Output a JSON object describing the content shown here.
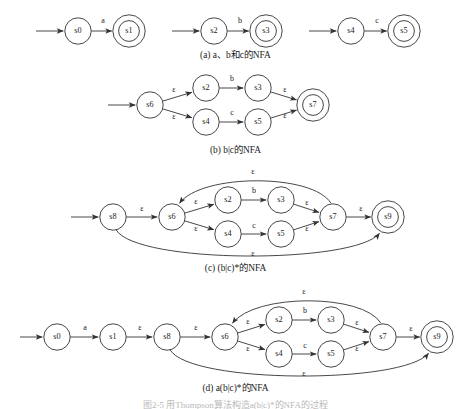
{
  "figure": {
    "footer_text": "图2-5  用Thompson算法构造a(b|c)*的NFA的过程",
    "stroke_color": "#333333",
    "text_color": "#1a1a1a",
    "background": "#ffffff"
  },
  "panels": [
    {
      "id": "a",
      "caption": "(a) a、b和c的NFA",
      "states": [
        {
          "name": "s0",
          "x": 78,
          "y": 31,
          "accepting": false
        },
        {
          "name": "s1",
          "x": 129,
          "y": 31,
          "accepting": true
        },
        {
          "name": "s2",
          "x": 214,
          "y": 31,
          "accepting": false
        },
        {
          "name": "s3",
          "x": 266,
          "y": 31,
          "accepting": true
        },
        {
          "name": "s4",
          "x": 351,
          "y": 31,
          "accepting": false
        },
        {
          "name": "s5",
          "x": 404,
          "y": 31,
          "accepting": true
        }
      ],
      "transitions": [
        {
          "from": "s0",
          "to": "s1",
          "label": "a",
          "label_x": 103,
          "label_y": 21
        },
        {
          "from": "s2",
          "to": "s3",
          "label": "b",
          "label_x": 240,
          "label_y": 21
        },
        {
          "from": "s4",
          "to": "s5",
          "label": "c",
          "label_x": 377,
          "label_y": 21
        }
      ],
      "start_arrows": [
        {
          "to": "s0",
          "from_x": 36,
          "y": 31
        },
        {
          "to": "s2",
          "from_x": 172,
          "y": 31
        },
        {
          "to": "s4",
          "from_x": 309,
          "y": 31
        }
      ]
    },
    {
      "id": "b",
      "caption": "(b) b|c的NFA",
      "states": [
        {
          "name": "s6",
          "x": 150,
          "y": 105,
          "accepting": false
        },
        {
          "name": "s2",
          "x": 206,
          "y": 88,
          "accepting": false
        },
        {
          "name": "s3",
          "x": 258,
          "y": 88,
          "accepting": false
        },
        {
          "name": "s4",
          "x": 206,
          "y": 122,
          "accepting": false
        },
        {
          "name": "s5",
          "x": 258,
          "y": 122,
          "accepting": false
        },
        {
          "name": "s7",
          "x": 313,
          "y": 105,
          "accepting": true
        }
      ],
      "transitions": [
        {
          "from": "s6",
          "to": "s2",
          "label": "ε",
          "label_x": 174,
          "label_y": 90
        },
        {
          "from": "s6",
          "to": "s4",
          "label": "ε",
          "label_x": 174,
          "label_y": 117
        },
        {
          "from": "s2",
          "to": "s3",
          "label": "b",
          "label_x": 232,
          "label_y": 79
        },
        {
          "from": "s4",
          "to": "s5",
          "label": "c",
          "label_x": 232,
          "label_y": 113
        },
        {
          "from": "s3",
          "to": "s7",
          "label": "ε",
          "label_x": 285,
          "label_y": 90
        },
        {
          "from": "s5",
          "to": "s7",
          "label": "ε",
          "label_x": 285,
          "label_y": 116
        }
      ],
      "start_arrows": [
        {
          "to": "s6",
          "from_x": 108,
          "y": 105
        }
      ]
    },
    {
      "id": "c",
      "caption": "(c) (b|c)*的NFA",
      "states": [
        {
          "name": "s8",
          "x": 113,
          "y": 217,
          "accepting": false
        },
        {
          "name": "s6",
          "x": 172,
          "y": 217,
          "accepting": false
        },
        {
          "name": "s2",
          "x": 228,
          "y": 200,
          "accepting": false
        },
        {
          "name": "s3",
          "x": 281,
          "y": 200,
          "accepting": false
        },
        {
          "name": "s4",
          "x": 228,
          "y": 234,
          "accepting": false
        },
        {
          "name": "s5",
          "x": 281,
          "y": 234,
          "accepting": false
        },
        {
          "name": "s7",
          "x": 333,
          "y": 217,
          "accepting": false
        },
        {
          "name": "s9",
          "x": 388,
          "y": 217,
          "accepting": true
        }
      ],
      "transitions": [
        {
          "from": "s8",
          "to": "s6",
          "label": "ε",
          "label_x": 142,
          "label_y": 209
        },
        {
          "from": "s6",
          "to": "s2",
          "label": "ε",
          "label_x": 196,
          "label_y": 202
        },
        {
          "from": "s6",
          "to": "s4",
          "label": "ε",
          "label_x": 196,
          "label_y": 229
        },
        {
          "from": "s2",
          "to": "s3",
          "label": "b",
          "label_x": 254,
          "label_y": 191
        },
        {
          "from": "s4",
          "to": "s5",
          "label": "c",
          "label_x": 254,
          "label_y": 226
        },
        {
          "from": "s3",
          "to": "s7",
          "label": "ε",
          "label_x": 307,
          "label_y": 203
        },
        {
          "from": "s5",
          "to": "s7",
          "label": "ε",
          "label_x": 307,
          "label_y": 229
        },
        {
          "from": "s7",
          "to": "s9",
          "label": "ε",
          "label_x": 361,
          "label_y": 209
        },
        {
          "from": "s7",
          "to": "s6",
          "label": "ε",
          "label_x": 253,
          "label_y": 172,
          "kind": "loop-back"
        },
        {
          "from": "s8",
          "to": "s9",
          "label": "ε",
          "label_x": 253,
          "label_y": 254,
          "kind": "bypass"
        }
      ],
      "start_arrows": [
        {
          "to": "s8",
          "from_x": 71,
          "y": 217
        }
      ]
    },
    {
      "id": "d",
      "caption": "(d) a(b|c)*的NFA",
      "states": [
        {
          "name": "s0",
          "x": 57,
          "y": 337,
          "accepting": false
        },
        {
          "name": "s1",
          "x": 113,
          "y": 337,
          "accepting": false
        },
        {
          "name": "s8",
          "x": 167,
          "y": 337,
          "accepting": false
        },
        {
          "name": "s6",
          "x": 225,
          "y": 337,
          "accepting": false
        },
        {
          "name": "s2",
          "x": 279,
          "y": 320,
          "accepting": false
        },
        {
          "name": "s3",
          "x": 331,
          "y": 320,
          "accepting": false
        },
        {
          "name": "s4",
          "x": 279,
          "y": 354,
          "accepting": false
        },
        {
          "name": "s5",
          "x": 331,
          "y": 354,
          "accepting": false
        },
        {
          "name": "s7",
          "x": 383,
          "y": 337,
          "accepting": false
        },
        {
          "name": "s9",
          "x": 437,
          "y": 337,
          "accepting": true
        }
      ],
      "transitions": [
        {
          "from": "s0",
          "to": "s1",
          "label": "a",
          "label_x": 85,
          "label_y": 328
        },
        {
          "from": "s1",
          "to": "s8",
          "label": "ε",
          "label_x": 140,
          "label_y": 328
        },
        {
          "from": "s8",
          "to": "s6",
          "label": "ε",
          "label_x": 196,
          "label_y": 328
        },
        {
          "from": "s6",
          "to": "s2",
          "label": "ε",
          "label_x": 248,
          "label_y": 322
        },
        {
          "from": "s6",
          "to": "s4",
          "label": "ε",
          "label_x": 248,
          "label_y": 349
        },
        {
          "from": "s2",
          "to": "s3",
          "label": "b",
          "label_x": 305,
          "label_y": 311
        },
        {
          "from": "s4",
          "to": "s5",
          "label": "c",
          "label_x": 305,
          "label_y": 346
        },
        {
          "from": "s3",
          "to": "s7",
          "label": "ε",
          "label_x": 357,
          "label_y": 323
        },
        {
          "from": "s5",
          "to": "s7",
          "label": "ε",
          "label_x": 357,
          "label_y": 349
        },
        {
          "from": "s7",
          "to": "s9",
          "label": "ε",
          "label_x": 411,
          "label_y": 329
        },
        {
          "from": "s7",
          "to": "s6",
          "label": "ε",
          "label_x": 304,
          "label_y": 292,
          "kind": "loop-back"
        },
        {
          "from": "s8",
          "to": "s9",
          "label": "ε",
          "label_x": 304,
          "label_y": 374,
          "kind": "bypass"
        }
      ],
      "start_arrows": [
        {
          "to": "s0",
          "from_x": 20,
          "y": 337
        }
      ]
    }
  ]
}
